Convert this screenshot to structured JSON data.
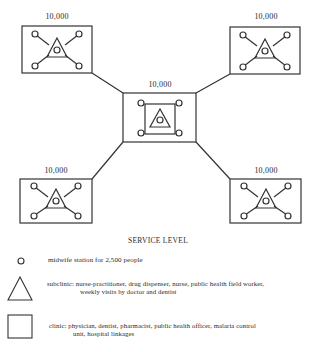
{
  "diagram": {
    "nodes": [
      {
        "id": "top-left",
        "population": "10,000",
        "type": "clinic-area"
      },
      {
        "id": "top-right",
        "population": "10,000",
        "type": "clinic-area"
      },
      {
        "id": "center",
        "population": "10,000",
        "type": "central-clinic"
      },
      {
        "id": "bottom-left",
        "population": "10,000",
        "type": "clinic-area"
      },
      {
        "id": "bottom-right",
        "population": "10,000",
        "type": "clinic-area"
      }
    ],
    "colors": {
      "line": "#333333",
      "background": "#ffffff"
    }
  },
  "legend": {
    "title": "SERVICE LEVEL",
    "items": [
      {
        "icon": "circle-icon",
        "line1": "midwife station for 2,500  people",
        "line2": ""
      },
      {
        "icon": "triangle-icon",
        "line1": "subclinic:  nurse-practitioner,  drug  dispenser,   nurse,  public health  field  worker,",
        "line2": "weekly  visits  by  doctor  and  dentist"
      },
      {
        "icon": "square-icon",
        "line1": "clinic:  physician, dentist, pharmacist, public health officer,  malaria control",
        "line2": "unit, hospital linkages"
      }
    ]
  }
}
